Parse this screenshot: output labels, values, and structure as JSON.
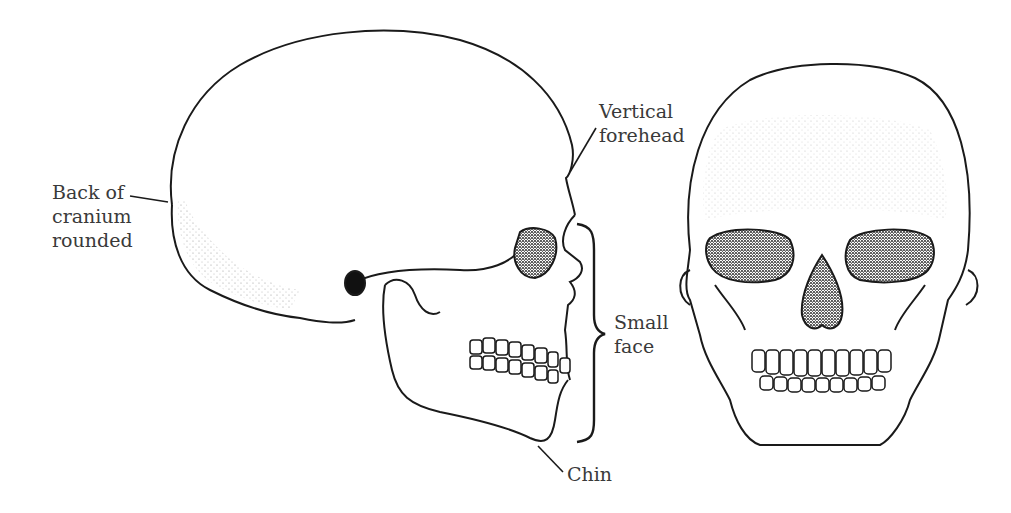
{
  "figure": {
    "labels": {
      "back_of_cranium": [
        "Back of",
        "cranium",
        "rounded"
      ],
      "vertical_forehead": [
        "Vertical",
        "forehead"
      ],
      "small_face": [
        "Small",
        "face"
      ],
      "chin": "Chin"
    },
    "colors": {
      "line": "#1a1a1a",
      "background": "#ffffff",
      "text": "#3a3a3a"
    }
  }
}
